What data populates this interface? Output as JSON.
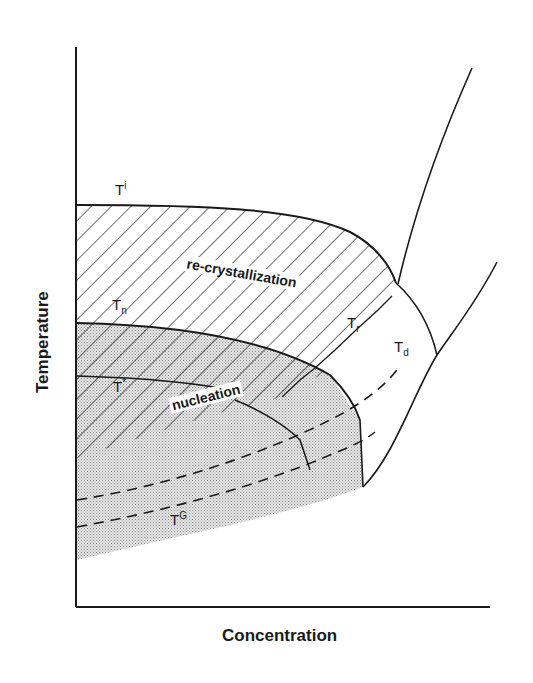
{
  "diagram": {
    "type": "phase diagram",
    "x_axis_label": "Concentration",
    "y_axis_label": "Temperature",
    "curves": {
      "ti": {
        "base": "T",
        "sup": "i"
      },
      "tn": {
        "base": "T",
        "sub": "n"
      },
      "tstar": {
        "base": "T",
        "sup": "*"
      },
      "tr": {
        "base": "T",
        "sub": "r"
      },
      "td": {
        "base": "T",
        "sub": "d"
      },
      "tg": {
        "base": "T",
        "sup": "G"
      }
    },
    "regions": {
      "recrystallization": "re-crystallization",
      "nucleation": "nucleation"
    },
    "colors": {
      "line": "#1a1a1a",
      "hatch": "#333333",
      "stipple": "#b8b8b8"
    }
  }
}
